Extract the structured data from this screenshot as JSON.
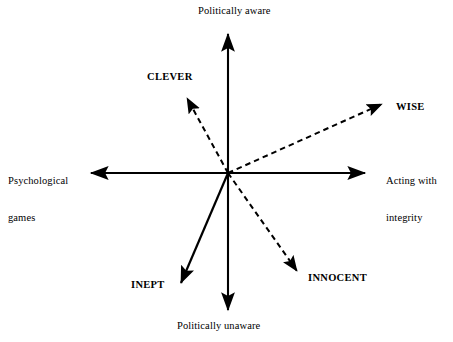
{
  "figure": {
    "type": "diagram",
    "subtype": "two-axis-quadrant-vector-map",
    "background_color": "#ffffff",
    "line_color": "#000000",
    "width": 453,
    "height": 342,
    "center": {
      "x": 228,
      "y": 173
    }
  },
  "axes": {
    "vertical": {
      "top_label": "Politically aware",
      "bottom_label": "Politically unaware",
      "style": "solid",
      "top_tip": {
        "x": 228,
        "y": 27
      },
      "bottom_tip": {
        "x": 228,
        "y": 317
      }
    },
    "horizontal": {
      "left_label": "Psychological\ngames",
      "left_label_line1": "Psychological",
      "left_label_line2": "games",
      "right_label": "Acting with\nintegrity",
      "right_label_line1": "Acting with",
      "right_label_line2": "integrity",
      "style": "solid",
      "left_tip": {
        "x": 84,
        "y": 173
      },
      "right_tip": {
        "x": 372,
        "y": 173
      }
    }
  },
  "vectors": [
    {
      "id": "clever",
      "label": "CLEVER",
      "style": "dashed",
      "quadrant": "upper-left",
      "tip": {
        "x": 183,
        "y": 92
      }
    },
    {
      "id": "wise",
      "label": "WISE",
      "style": "dashed",
      "quadrant": "upper-right",
      "tip": {
        "x": 390,
        "y": 101
      }
    },
    {
      "id": "innocent",
      "label": "INNOCENT",
      "style": "dashed",
      "quadrant": "lower-right",
      "tip": {
        "x": 303,
        "y": 278
      }
    },
    {
      "id": "inept",
      "label": "INEPT",
      "style": "solid",
      "quadrant": "lower-left",
      "tip": {
        "x": 176,
        "y": 290
      }
    }
  ]
}
